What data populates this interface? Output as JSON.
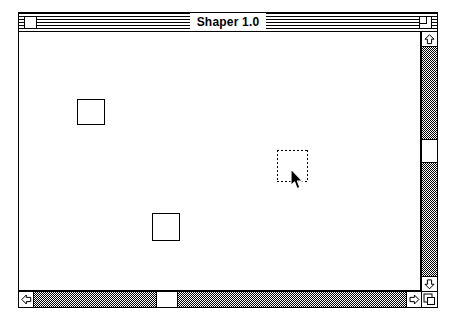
{
  "window": {
    "title": "Shaper 1.0",
    "close_box_label": "close-box",
    "zoom_box_label": "zoom-box",
    "frame": {
      "left": 18,
      "top": 12,
      "width": 420,
      "height": 296
    }
  },
  "canvas": {
    "background_color": "#ffffff",
    "stroke_color": "#000000",
    "shapes": [
      {
        "name": "square-1",
        "type": "square",
        "left": 58,
        "top": 67,
        "width": 28,
        "height": 26,
        "selected": false
      },
      {
        "name": "square-2",
        "type": "square",
        "left": 133,
        "top": 181,
        "width": 28,
        "height": 28,
        "selected": false
      },
      {
        "name": "square-3-selected",
        "type": "square",
        "left": 258,
        "top": 118,
        "width": 31,
        "height": 32,
        "selected": true
      }
    ],
    "cursor": {
      "name": "arrow-cursor",
      "left": 271,
      "top": 137
    }
  },
  "scrollbars": {
    "vertical": {
      "up_arrow": "▲",
      "down_arrow": "▼",
      "thumb_top": 92,
      "thumb_height": 24
    },
    "horizontal": {
      "left_arrow": "◀",
      "right_arrow": "▶",
      "thumb_left": 122,
      "thumb_width": 22
    },
    "grow_box": "grow-box"
  },
  "colors": {
    "black": "#000000",
    "white": "#ffffff",
    "track_pattern": "50% dither gray"
  }
}
